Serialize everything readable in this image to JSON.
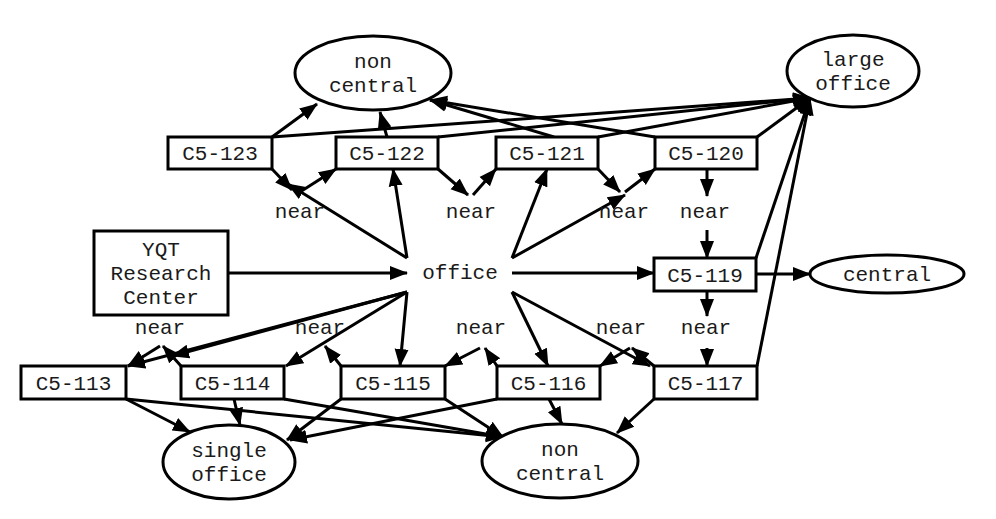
{
  "diagram": {
    "type": "semantic-network",
    "nodes": [
      {
        "id": "c5_123",
        "shape": "rect",
        "lines": [
          "C5-123"
        ],
        "x": 168,
        "y": 137,
        "w": 104,
        "h": 32
      },
      {
        "id": "c5_122",
        "shape": "rect",
        "lines": [
          "C5-122"
        ],
        "x": 336,
        "y": 137,
        "w": 102,
        "h": 32
      },
      {
        "id": "c5_121",
        "shape": "rect",
        "lines": [
          "C5-121"
        ],
        "x": 496,
        "y": 137,
        "w": 102,
        "h": 32
      },
      {
        "id": "c5_120",
        "shape": "rect",
        "lines": [
          "C5-120"
        ],
        "x": 655,
        "y": 137,
        "w": 102,
        "h": 32
      },
      {
        "id": "non_central_top",
        "shape": "ellipse",
        "lines": [
          "non",
          "central"
        ],
        "cx": 373,
        "cy": 73,
        "rx": 78,
        "ry": 37
      },
      {
        "id": "large_office",
        "shape": "ellipse",
        "lines": [
          "large",
          "office"
        ],
        "cx": 853,
        "cy": 71,
        "rx": 66,
        "ry": 36
      },
      {
        "id": "yqt",
        "shape": "rect",
        "lines": [
          "YQT",
          "Research",
          "Center"
        ],
        "x": 94,
        "y": 231,
        "w": 134,
        "h": 84
      },
      {
        "id": "office",
        "shape": "text",
        "lines": [
          "office"
        ],
        "cx": 460,
        "cy": 272
      },
      {
        "id": "c5_119",
        "shape": "rect",
        "lines": [
          "C5-119"
        ],
        "x": 654,
        "y": 258,
        "w": 102,
        "h": 33
      },
      {
        "id": "central",
        "shape": "ellipse",
        "lines": [
          "central"
        ],
        "cx": 887,
        "cy": 274,
        "rx": 77,
        "ry": 19
      },
      {
        "id": "c5_113",
        "shape": "rect",
        "lines": [
          "C5-113"
        ],
        "x": 21,
        "y": 366,
        "w": 105,
        "h": 33
      },
      {
        "id": "c5_114",
        "shape": "rect",
        "lines": [
          "C5-114"
        ],
        "x": 181,
        "y": 366,
        "w": 103,
        "h": 33
      },
      {
        "id": "c5_115",
        "shape": "rect",
        "lines": [
          "C5-115"
        ],
        "x": 341,
        "y": 366,
        "w": 104,
        "h": 33
      },
      {
        "id": "c5_116",
        "shape": "rect",
        "lines": [
          "C5-116"
        ],
        "x": 497,
        "y": 366,
        "w": 103,
        "h": 33
      },
      {
        "id": "c5_117",
        "shape": "rect",
        "lines": [
          "C5-117"
        ],
        "x": 654,
        "y": 366,
        "w": 103,
        "h": 33
      },
      {
        "id": "single_office",
        "shape": "ellipse",
        "lines": [
          "single",
          "office"
        ],
        "cx": 229,
        "cy": 462,
        "rx": 66,
        "ry": 37
      },
      {
        "id": "non_central_bottom",
        "shape": "ellipse",
        "lines": [
          "non",
          "central"
        ],
        "cx": 560,
        "cy": 461,
        "rx": 78,
        "ry": 37
      }
    ],
    "labels": [
      {
        "id": "near_1",
        "text": "near",
        "x": 300,
        "y": 218
      },
      {
        "id": "near_2",
        "text": "near",
        "x": 471,
        "y": 218
      },
      {
        "id": "near_3",
        "text": "near",
        "x": 624,
        "y": 218
      },
      {
        "id": "near_4",
        "text": "near",
        "x": 705,
        "y": 218
      },
      {
        "id": "near_5",
        "text": "near",
        "x": 160,
        "y": 334
      },
      {
        "id": "near_6",
        "text": "near",
        "x": 320,
        "y": 334
      },
      {
        "id": "near_7",
        "text": "near",
        "x": 481,
        "y": 334
      },
      {
        "id": "near_8",
        "text": "near",
        "x": 621,
        "y": 334
      },
      {
        "id": "near_9",
        "text": "near",
        "x": 706,
        "y": 334
      }
    ],
    "edges": [
      {
        "from": "c5_123",
        "to": "non_central_top",
        "points": [
          [
            272,
            137
          ],
          [
            317,
            104
          ]
        ],
        "arrow": true
      },
      {
        "from": "c5_122",
        "to": "non_central_top",
        "points": [
          [
            387,
            137
          ],
          [
            380,
            112
          ]
        ],
        "arrow": true
      },
      {
        "from": "c5_121",
        "to": "non_central_top",
        "points": [
          [
            554,
            137
          ],
          [
            430,
            100
          ]
        ],
        "arrow": true
      },
      {
        "from": "c5_120",
        "to": "non_central_top",
        "points": [
          [
            655,
            137
          ],
          [
            430,
            100
          ]
        ],
        "arrow": true
      },
      {
        "from": "c5_123",
        "to": "large_office",
        "points": [
          [
            272,
            137
          ],
          [
            810,
            98
          ]
        ],
        "arrow": true
      },
      {
        "from": "c5_122",
        "to": "large_office",
        "points": [
          [
            438,
            137
          ],
          [
            810,
            98
          ]
        ],
        "arrow": true
      },
      {
        "from": "c5_121",
        "to": "large_office",
        "points": [
          [
            598,
            137
          ],
          [
            810,
            98
          ]
        ],
        "arrow": true
      },
      {
        "from": "c5_120",
        "to": "large_office",
        "points": [
          [
            757,
            137
          ],
          [
            810,
            98
          ]
        ],
        "arrow": true
      },
      {
        "from": "c5_119",
        "to": "large_office",
        "points": [
          [
            756,
            258
          ],
          [
            810,
            98
          ]
        ],
        "arrow": true
      },
      {
        "from": "c5_117",
        "to": "large_office",
        "points": [
          [
            757,
            366
          ],
          [
            810,
            98
          ]
        ],
        "arrow": true
      },
      {
        "from": "c5_123",
        "to": "near_1",
        "points": [
          [
            272,
            169
          ],
          [
            292,
            190
          ]
        ],
        "arrow": true
      },
      {
        "from": "near_1",
        "to": "c5_122",
        "points": [
          [
            300,
            192
          ],
          [
            336,
            169
          ]
        ],
        "arrow": true
      },
      {
        "from": "c5_122",
        "to": "near_2",
        "points": [
          [
            438,
            169
          ],
          [
            468,
            195
          ]
        ],
        "arrow": true
      },
      {
        "from": "near_2",
        "to": "c5_121",
        "points": [
          [
            473,
            195
          ],
          [
            496,
            169
          ]
        ],
        "arrow": true
      },
      {
        "from": "c5_121",
        "to": "near_3",
        "points": [
          [
            598,
            169
          ],
          [
            620,
            192
          ]
        ],
        "arrow": true
      },
      {
        "from": "near_3",
        "to": "c5_120",
        "points": [
          [
            625,
            192
          ],
          [
            655,
            169
          ]
        ],
        "arrow": true
      },
      {
        "from": "c5_120",
        "to": "near_4",
        "points": [
          [
            707,
            169
          ],
          [
            707,
            196
          ]
        ],
        "arrow": true
      },
      {
        "from": "near_4",
        "to": "c5_119",
        "points": [
          [
            707,
            230
          ],
          [
            707,
            258
          ]
        ],
        "arrow": true
      },
      {
        "from": "c5_119",
        "to": "near_9",
        "points": [
          [
            707,
            291
          ],
          [
            707,
            316
          ]
        ],
        "arrow": true
      },
      {
        "from": "near_9",
        "to": "c5_117",
        "points": [
          [
            707,
            348
          ],
          [
            707,
            366
          ]
        ],
        "arrow": true
      },
      {
        "from": "office",
        "to": "near_1",
        "points": [
          [
            407,
            258
          ],
          [
            288,
            184
          ]
        ],
        "arrow": true
      },
      {
        "from": "office",
        "to": "c5_122",
        "points": [
          [
            407,
            258
          ],
          [
            393,
            169
          ]
        ],
        "arrow": true
      },
      {
        "from": "office",
        "to": "c5_121",
        "points": [
          [
            512,
            258
          ],
          [
            547,
            169
          ]
        ],
        "arrow": true
      },
      {
        "from": "office",
        "to": "near_3",
        "points": [
          [
            512,
            258
          ],
          [
            625,
            195
          ]
        ],
        "arrow": true
      },
      {
        "from": "yqt",
        "to": "office",
        "points": [
          [
            228,
            273
          ],
          [
            407,
            273
          ]
        ],
        "arrow": true
      },
      {
        "from": "office",
        "to": "c5_119",
        "points": [
          [
            512,
            273
          ],
          [
            654,
            273
          ]
        ],
        "arrow": true
      },
      {
        "from": "c5_119",
        "to": "central",
        "points": [
          [
            756,
            274
          ],
          [
            810,
            274
          ]
        ],
        "arrow": true
      },
      {
        "from": "office",
        "to": "c5_113",
        "points": [
          [
            407,
            292
          ],
          [
            128,
            366
          ]
        ],
        "arrow": true
      },
      {
        "from": "office",
        "to": "near_5",
        "points": [
          [
            407,
            292
          ],
          [
            172,
            356
          ]
        ],
        "arrow": true
      },
      {
        "from": "office",
        "to": "c5_114",
        "points": [
          [
            407,
            292
          ],
          [
            286,
            366
          ]
        ],
        "arrow": true
      },
      {
        "from": "office",
        "to": "c5_115",
        "points": [
          [
            407,
            292
          ],
          [
            400,
            366
          ]
        ],
        "arrow": true
      },
      {
        "from": "office",
        "to": "c5_116",
        "points": [
          [
            512,
            292
          ],
          [
            548,
            366
          ]
        ],
        "arrow": true
      },
      {
        "from": "office",
        "to": "c5_117",
        "points": [
          [
            512,
            292
          ],
          [
            650,
            366
          ]
        ],
        "arrow": true
      },
      {
        "from": "near_5",
        "to": "c5_113",
        "points": [
          [
            160,
            346
          ],
          [
            128,
            366
          ]
        ],
        "arrow": true
      },
      {
        "from": "c5_114",
        "to": "near_5",
        "points": [
          [
            181,
            366
          ],
          [
            163,
            346
          ]
        ],
        "arrow": true
      },
      {
        "from": "c5_115",
        "to": "near_6",
        "points": [
          [
            341,
            366
          ],
          [
            325,
            346
          ]
        ],
        "arrow": true
      },
      {
        "from": "near_7",
        "to": "c5_115",
        "points": [
          [
            480,
            348
          ],
          [
            445,
            366
          ]
        ],
        "arrow": true
      },
      {
        "from": "c5_116",
        "to": "near_7",
        "points": [
          [
            497,
            366
          ],
          [
            485,
            348
          ]
        ],
        "arrow": true
      },
      {
        "from": "near_8",
        "to": "c5_116",
        "points": [
          [
            630,
            348
          ],
          [
            600,
            366
          ]
        ],
        "arrow": true
      },
      {
        "from": "c5_117",
        "to": "near_8",
        "points": [
          [
            654,
            366
          ],
          [
            632,
            348
          ]
        ],
        "arrow": true
      },
      {
        "from": "c5_113",
        "to": "single_office",
        "points": [
          [
            126,
            399
          ],
          [
            190,
            432
          ]
        ],
        "arrow": true
      },
      {
        "from": "c5_114",
        "to": "single_office",
        "points": [
          [
            234,
            399
          ],
          [
            240,
            425
          ]
        ],
        "arrow": true
      },
      {
        "from": "c5_115",
        "to": "single_office",
        "points": [
          [
            341,
            399
          ],
          [
            287,
            440
          ]
        ],
        "arrow": true
      },
      {
        "from": "c5_116",
        "to": "single_office",
        "points": [
          [
            497,
            399
          ],
          [
            290,
            440
          ]
        ],
        "arrow": true
      },
      {
        "from": "c5_113",
        "to": "non_central_bottom",
        "points": [
          [
            126,
            399
          ],
          [
            503,
            437
          ]
        ],
        "arrow": true
      },
      {
        "from": "c5_114",
        "to": "non_central_bottom",
        "points": [
          [
            284,
            399
          ],
          [
            503,
            437
          ]
        ],
        "arrow": true
      },
      {
        "from": "c5_115",
        "to": "non_central_bottom",
        "points": [
          [
            445,
            399
          ],
          [
            503,
            437
          ]
        ],
        "arrow": true
      },
      {
        "from": "c5_116",
        "to": "non_central_bottom",
        "points": [
          [
            549,
            399
          ],
          [
            562,
            424
          ]
        ],
        "arrow": true
      },
      {
        "from": "c5_117",
        "to": "non_central_bottom",
        "points": [
          [
            654,
            399
          ],
          [
            617,
            433
          ]
        ],
        "arrow": true
      }
    ]
  }
}
